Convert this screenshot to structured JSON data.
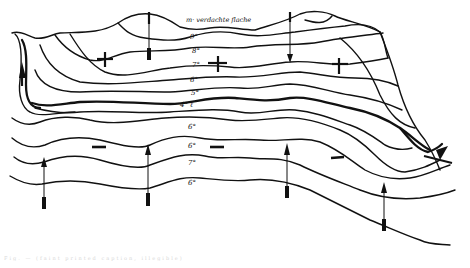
{
  "diagram": {
    "surface_label": "m· verdachte flache",
    "isotherm_labels": [
      {
        "id": "t9",
        "text": "9°",
        "x": 190,
        "y": 33
      },
      {
        "id": "t8",
        "text": "8°",
        "x": 192,
        "y": 48
      },
      {
        "id": "t7",
        "text": "7°",
        "x": 192,
        "y": 62
      },
      {
        "id": "t6a",
        "text": "6°",
        "x": 190,
        "y": 78
      },
      {
        "id": "t5",
        "text": "5°",
        "x": 191,
        "y": 91
      },
      {
        "id": "t4",
        "text": "4° ℓ",
        "x": 180,
        "y": 103
      },
      {
        "id": "t6b",
        "text": "6°",
        "x": 188,
        "y": 124
      },
      {
        "id": "t6c",
        "text": "6°",
        "x": 188,
        "y": 143
      },
      {
        "id": "t7b",
        "text": "7°",
        "x": 188,
        "y": 163
      },
      {
        "id": "t6d",
        "text": "6°",
        "x": 188,
        "y": 182
      }
    ],
    "plus_marks": [
      {
        "id": "plus-1",
        "symbol": "+",
        "x": 105,
        "y": 58
      },
      {
        "id": "plus-2",
        "symbol": "+",
        "x": 218,
        "y": 62
      },
      {
        "id": "plus-3",
        "symbol": "+",
        "x": 340,
        "y": 66
      }
    ],
    "minus_marks": [
      {
        "id": "minus-1",
        "symbol": "−",
        "x": 99,
        "y": 147
      },
      {
        "id": "minus-2",
        "symbol": "−",
        "x": 216,
        "y": 147
      },
      {
        "id": "minus-3",
        "symbol": "−",
        "x": 337,
        "y": 158
      }
    ],
    "arrows": [
      {
        "id": "arrow-down-left",
        "direction": "down",
        "x": 149
      },
      {
        "id": "arrow-down-right",
        "direction": "down",
        "x": 290
      },
      {
        "id": "arrow-up-edge",
        "direction": "up",
        "x": 22
      },
      {
        "id": "arrow-up-1",
        "direction": "up",
        "x": 44
      },
      {
        "id": "arrow-up-2",
        "direction": "up",
        "x": 148
      },
      {
        "id": "arrow-up-3",
        "direction": "up",
        "x": 287
      },
      {
        "id": "arrow-up-4",
        "direction": "up",
        "x": 384
      },
      {
        "id": "arrow-diag-right",
        "direction": "up-right",
        "x": 440
      }
    ],
    "caption": "Fig. — (faint printed caption, illegible)"
  }
}
